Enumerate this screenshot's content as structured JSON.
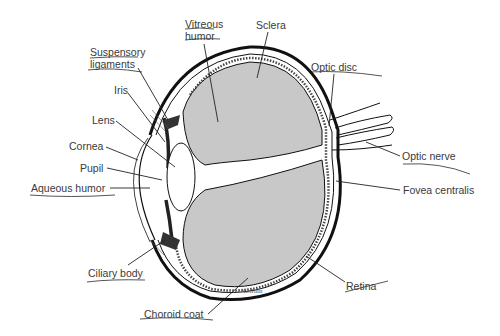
{
  "diagram": {
    "colors": {
      "fill_gray": "#c8c8c8",
      "line": "#111111",
      "text": "#3a3a3a",
      "underline": "#555555"
    },
    "labels": {
      "vitreous_humor_1": "Vitreous",
      "vitreous_humor_2": "humor",
      "sclera": "Sclera",
      "suspensory_1": "Suspensory",
      "suspensory_2": "ligaments",
      "optic_disc": "Optic disc",
      "iris": "Iris",
      "lens": "Lens",
      "cornea": "Cornea",
      "pupil": "Pupil",
      "aqueous_humor": "Aqueous humor",
      "optic_nerve": "Optic nerve",
      "fovea_centralis": "Fovea centralis",
      "ciliary_body": "Ciliary body",
      "retina": "Retina",
      "choroid_coat": "Choroid coat"
    },
    "signature": "Goldin"
  }
}
